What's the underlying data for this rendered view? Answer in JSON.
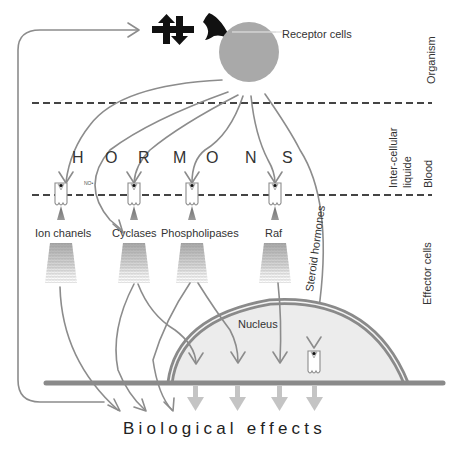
{
  "diagram": {
    "top_labels": {
      "receptor_cells": "Receptor cells",
      "organism": "Organism"
    },
    "hormons_letters": [
      "H",
      "O",
      "R",
      "M",
      "O",
      "N",
      "S"
    ],
    "no_label": "NO•",
    "side_labels": {
      "inter_cellular": "Inter-cellular",
      "liquide": "liquide",
      "blood": "Blood",
      "effector_cells": "Effector cells"
    },
    "effectors": [
      {
        "label": "Ion chanels"
      },
      {
        "label": "Cyclases"
      },
      {
        "label": "Phospholipases"
      },
      {
        "label": "Raf"
      }
    ],
    "steroid_label": "Steroid hormones",
    "nucleus_label": "Nucleus",
    "bottom_label": "Biological effects",
    "icons": [
      "bidirectional-arrows-icon",
      "receptor-claw-icon"
    ],
    "colors": {
      "receptor_circle": "#a9a9a9",
      "flow_lines": "#8c8c8c",
      "membrane": "#8a8a8a",
      "nucleus_fill": "#ececec",
      "output_arrows": "#c4c4c4",
      "dashed_lines": "#444444",
      "icon_black": "#111111"
    }
  }
}
